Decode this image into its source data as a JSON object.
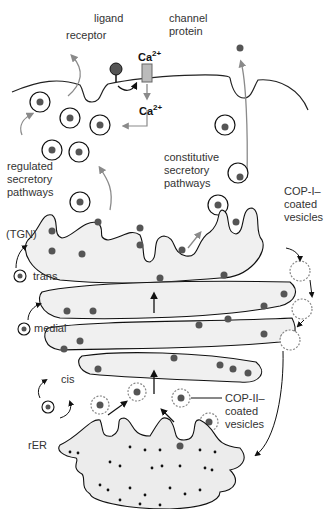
{
  "labels": {
    "ligand": "ligand",
    "receptor": "receptor",
    "channel_protein": "channel\nprotein",
    "ca_top": "Ca",
    "ca_bottom": "Ca",
    "ca_charge": "2+",
    "regulated": "regulated\nsecretory\npathways",
    "constitutive": "constitutive\nsecretory\npathways",
    "tgn": "(TGN)",
    "trans": "trans",
    "medial": "medial",
    "cis": "cis",
    "cop1": "COP-I–\ncoated\nvesicles",
    "cop2": "COP-II–\ncoated\nvesicles",
    "rer": "rER"
  },
  "colors": {
    "cargo": "#555555",
    "lumen": "#f0f0f0",
    "arrow_gray": "#8a8a8a",
    "arrow_black": "#111111",
    "ribosome": "#111111"
  }
}
